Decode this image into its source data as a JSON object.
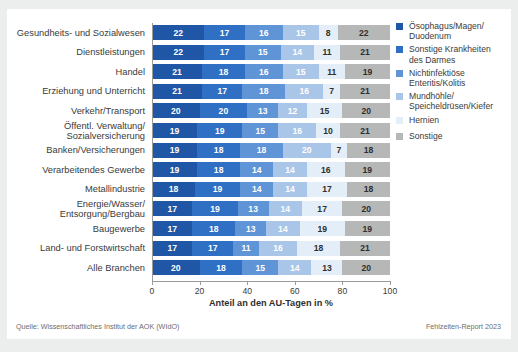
{
  "footer": {
    "source": "Quelle: Wissenschaftliches Institut der AOK (WIdO)",
    "report": "Fehlzeiten-Report 2023"
  },
  "chart_data": {
    "type": "bar",
    "orientation": "horizontal",
    "stacked": true,
    "normalized_percent": true,
    "title": "",
    "xlabel": "Anteil an den AU-Tagen in %",
    "ylabel": "",
    "xlim": [
      0,
      100
    ],
    "xticks": [
      0,
      20,
      40,
      60,
      80,
      100
    ],
    "grid": false,
    "legend_position": "right",
    "colors": [
      "#1f56a5",
      "#2f6fc4",
      "#5f94d6",
      "#a9c6e8",
      "#e4eef8",
      "#b6b7b7"
    ],
    "series": [
      {
        "name": "Ösophagus/Magen/\nDuodenum",
        "color": "#1f56a5"
      },
      {
        "name": "Sonstige Krankheiten\ndes Darmes",
        "color": "#2f6fc4"
      },
      {
        "name": "Nichtinfektiöse\nEnteritis/Kolitis",
        "color": "#5f94d6"
      },
      {
        "name": "Mundhöhle/\nSpeicheldrüsen/Kiefer",
        "color": "#a9c6e8"
      },
      {
        "name": "Hernien",
        "color": "#e4eef8"
      },
      {
        "name": "Sonstige",
        "color": "#b6b7b7"
      }
    ],
    "categories": [
      "Gesundheits- und Sozialwesen",
      "Dienstleistungen",
      "Handel",
      "Erziehung und Unterricht",
      "Verkehr/Transport",
      "Öffentl. Verwaltung/\nSozialversicherung",
      "Banken/Versicherungen",
      "Verarbeitendes Gewerbe",
      "Metallindustrie",
      "Energie/Wasser/\nEntsorgung/Bergbau",
      "Baugewerbe",
      "Land- und Forstwirtschaft",
      "Alle Branchen"
    ],
    "values": [
      [
        22,
        17,
        16,
        15,
        8,
        22
      ],
      [
        22,
        17,
        15,
        14,
        11,
        21
      ],
      [
        21,
        18,
        16,
        15,
        11,
        19
      ],
      [
        21,
        17,
        18,
        16,
        7,
        21
      ],
      [
        20,
        20,
        13,
        12,
        15,
        20
      ],
      [
        19,
        19,
        15,
        16,
        10,
        21
      ],
      [
        19,
        18,
        18,
        20,
        7,
        18
      ],
      [
        19,
        18,
        14,
        14,
        16,
        19
      ],
      [
        18,
        19,
        14,
        14,
        17,
        18
      ],
      [
        17,
        19,
        13,
        14,
        17,
        20
      ],
      [
        17,
        18,
        13,
        14,
        19,
        19
      ],
      [
        17,
        17,
        11,
        16,
        18,
        21
      ],
      [
        20,
        18,
        15,
        14,
        13,
        20
      ]
    ]
  }
}
